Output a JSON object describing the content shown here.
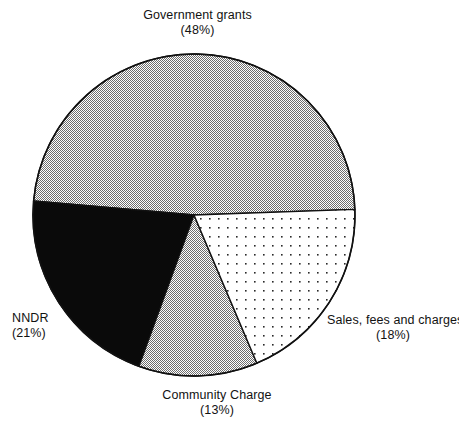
{
  "chart_data": {
    "type": "pie",
    "title": "",
    "subtitle": "",
    "xlabel": "",
    "ylabel": "",
    "legend_position": "callout-labels",
    "grid": false,
    "units": "percent",
    "total": 100,
    "categories": [
      "Government grants",
      "NNDR",
      "Community Charge",
      "Sales, fees and charges"
    ],
    "values": [
      48,
      21,
      13,
      18
    ],
    "labels": [
      "(48%)",
      "(21%)",
      "(13%)",
      "(18%)"
    ],
    "slices": [
      {
        "name": "Government grants",
        "value": 48,
        "pct_label": "(48%)",
        "fill": "grey-halftone",
        "color": "#a8a8a8",
        "start_angle_deg": 2,
        "end_angle_deg": 175,
        "label_position": "top"
      },
      {
        "name": "NNDR",
        "value": 21,
        "pct_label": "(21%)",
        "fill": "solid-black",
        "color": "#000000",
        "start_angle_deg": 175,
        "end_angle_deg": 250,
        "label_position": "left"
      },
      {
        "name": "Community Charge",
        "value": 13,
        "pct_label": "(13%)",
        "fill": "grey-halftone",
        "color": "#a8a8a8",
        "start_angle_deg": 250,
        "end_angle_deg": 293,
        "label_position": "bottom"
      },
      {
        "name": "Sales, fees and charges",
        "value": 18,
        "pct_label": "(18%)",
        "fill": "white-dotted",
        "color": "#ffffff",
        "start_angle_deg": 293,
        "end_angle_deg": 362,
        "label_position": "right"
      }
    ],
    "geometry": {
      "center_x": 194,
      "center_y": 215,
      "radius": 161
    },
    "colors": {
      "outline": "#000000",
      "grey_fill": "#a8a8a8",
      "black_fill": "#000000",
      "white_fill": "#ffffff",
      "background": "#ffffff",
      "text": "#121212"
    }
  }
}
